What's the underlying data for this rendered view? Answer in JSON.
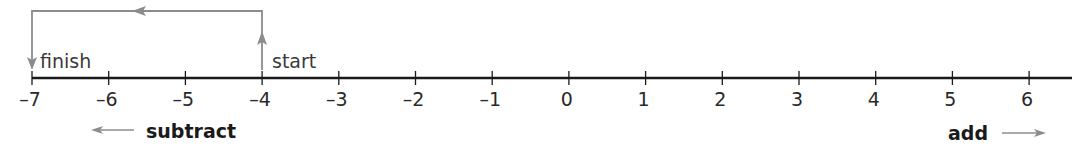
{
  "diagram": {
    "type": "number-line",
    "axis": {
      "min": -7,
      "max": 6,
      "ticks": [
        "–7",
        "–6",
        "–5",
        "–4",
        "–3",
        "–2",
        "–1",
        "0",
        "1",
        "2",
        "3",
        "4",
        "5",
        "6"
      ]
    },
    "path": {
      "start_value": -4,
      "finish_value": -7,
      "start_label": "start",
      "finish_label": "finish"
    },
    "directions": {
      "left_label": "subtract",
      "right_label": "add"
    },
    "colors": {
      "axis": "#1a1a1a",
      "path": "#8c8c8c",
      "text": "#2a2a2a"
    }
  }
}
